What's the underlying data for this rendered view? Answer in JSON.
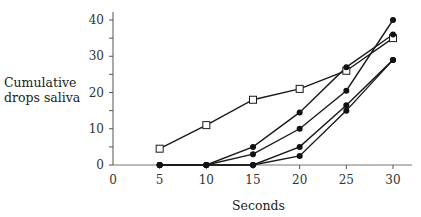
{
  "chart_data": {
    "type": "line",
    "title": "",
    "xlabel": "Seconds",
    "ylabel": "Cumulative drops saliva",
    "x": [
      5,
      10,
      15,
      20,
      25,
      30
    ],
    "xticks": [
      "0",
      "5",
      "10",
      "15",
      "20",
      "25",
      "30"
    ],
    "yticks": [
      "0",
      "10",
      "20",
      "30",
      "40"
    ],
    "xlim": [
      0,
      30
    ],
    "ylim": [
      0,
      40
    ],
    "grid": false,
    "legend": "none",
    "series": [
      {
        "name": "open-square series",
        "marker": "open-square",
        "values": [
          4.5,
          11,
          18,
          21,
          26,
          35
        ]
      },
      {
        "name": "filled series 1",
        "marker": "filled-circle",
        "values": [
          0,
          0,
          5,
          14.5,
          27,
          36
        ]
      },
      {
        "name": "filled series 2",
        "marker": "filled-circle",
        "values": [
          0,
          0,
          3,
          10,
          20.5,
          40
        ]
      },
      {
        "name": "filled series 3",
        "marker": "filled-circle",
        "values": [
          0,
          0,
          0,
          5,
          16.5,
          29
        ]
      },
      {
        "name": "filled series 4",
        "marker": "filled-circle",
        "values": [
          0,
          0,
          0,
          2.5,
          15,
          29
        ]
      }
    ]
  }
}
